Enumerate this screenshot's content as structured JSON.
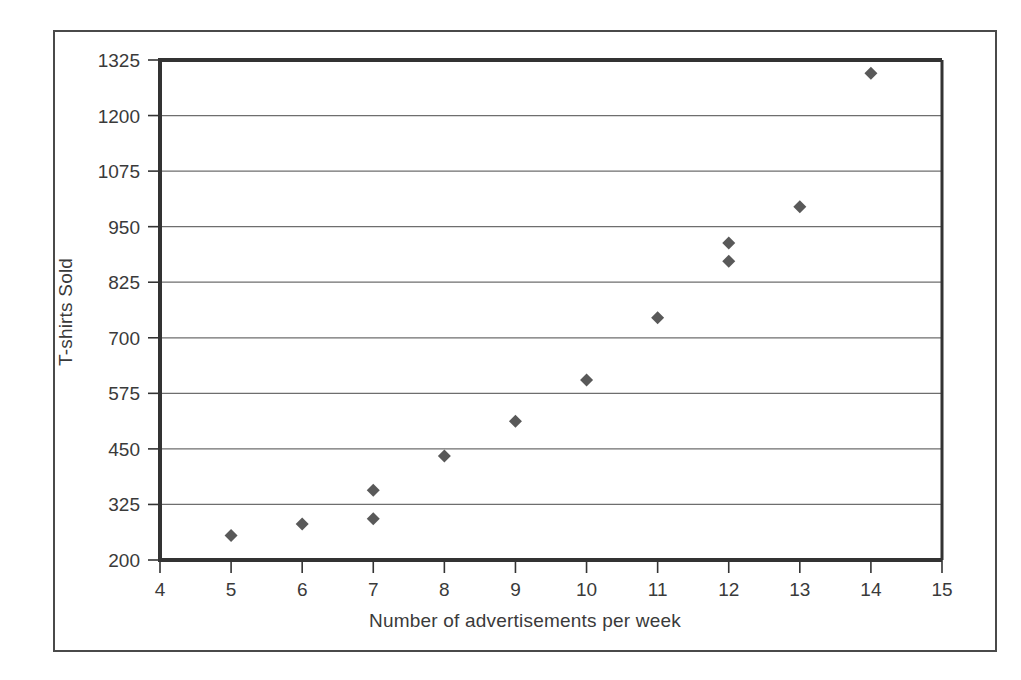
{
  "chart_data": {
    "type": "scatter",
    "title": "",
    "xlabel": "Number of advertisements per week",
    "ylabel": "T-shirts Sold",
    "xlim": [
      4,
      15
    ],
    "ylim": [
      200,
      1325
    ],
    "xticks": [
      4,
      5,
      6,
      7,
      8,
      9,
      10,
      11,
      12,
      13,
      14,
      15
    ],
    "yticks": [
      200,
      325,
      450,
      575,
      700,
      825,
      950,
      1075,
      1200,
      1325
    ],
    "grid": "horizontal",
    "legend": null,
    "marker": "diamond",
    "marker_color": "#595959",
    "series": [
      {
        "name": "T-shirts Sold",
        "points": [
          {
            "x": 5,
            "y": 255
          },
          {
            "x": 6,
            "y": 281
          },
          {
            "x": 7,
            "y": 293
          },
          {
            "x": 7,
            "y": 357
          },
          {
            "x": 8,
            "y": 434
          },
          {
            "x": 9,
            "y": 512
          },
          {
            "x": 10,
            "y": 605
          },
          {
            "x": 11,
            "y": 745
          },
          {
            "x": 12,
            "y": 872
          },
          {
            "x": 12,
            "y": 913
          },
          {
            "x": 13,
            "y": 995
          },
          {
            "x": 14,
            "y": 1295
          }
        ]
      }
    ]
  },
  "colors": {
    "frame": "#4a4a4a",
    "axis": "#333333",
    "gridline": "#6e6e6e",
    "marker": "#595959",
    "text": "#3a3a3a"
  }
}
